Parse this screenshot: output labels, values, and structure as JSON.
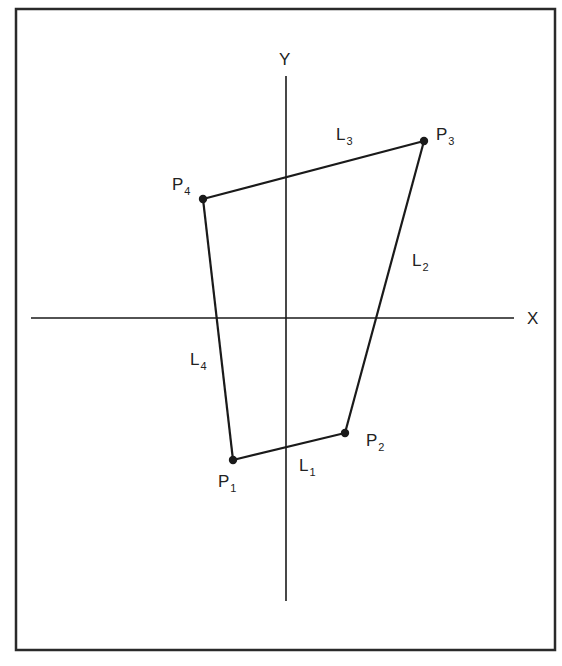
{
  "figure": {
    "frame": {
      "x": 16,
      "y": 9,
      "width": 539,
      "height": 641
    },
    "axes": {
      "x_axis": {
        "label": "X",
        "x1": 31,
        "y": 318,
        "x2": 514,
        "label_x": 527,
        "label_y": 324
      },
      "y_axis": {
        "label": "Y",
        "x": 286,
        "y1": 76,
        "y2": 601,
        "label_x": 279,
        "label_y": 65
      }
    },
    "points": [
      {
        "id": "P1",
        "main": "P",
        "sub": "1",
        "x": 233,
        "y": 460,
        "label_x": 218,
        "label_y": 487
      },
      {
        "id": "P2",
        "main": "P",
        "sub": "2",
        "x": 345,
        "y": 433,
        "label_x": 366,
        "label_y": 446
      },
      {
        "id": "P3",
        "main": "P",
        "sub": "3",
        "x": 424,
        "y": 141,
        "label_x": 436,
        "label_y": 140
      },
      {
        "id": "P4",
        "main": "P",
        "sub": "4",
        "x": 203,
        "y": 199,
        "label_x": 172,
        "label_y": 190
      }
    ],
    "lines": [
      {
        "id": "L1",
        "main": "L",
        "sub": "1",
        "from": "P1",
        "to": "P2",
        "label_x": 299,
        "label_y": 471
      },
      {
        "id": "L2",
        "main": "L",
        "sub": "2",
        "from": "P2",
        "to": "P3",
        "label_x": 412,
        "label_y": 266
      },
      {
        "id": "L3",
        "main": "L",
        "sub": "3",
        "from": "P3",
        "to": "P4",
        "label_x": 336,
        "label_y": 140
      },
      {
        "id": "L4",
        "main": "L",
        "sub": "4",
        "from": "P4",
        "to": "P1",
        "label_x": 190,
        "label_y": 365
      }
    ],
    "colors": {
      "stroke": "#1a1a1a",
      "frame": "#2a2a2a",
      "text": "#222222"
    }
  }
}
